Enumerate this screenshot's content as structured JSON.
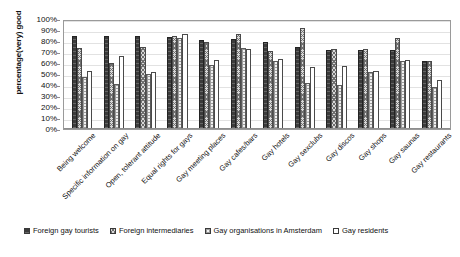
{
  "chart_data": {
    "type": "bar",
    "title": "",
    "xlabel": "",
    "ylabel": "percentage(very) good",
    "ylim": [
      0,
      100
    ],
    "grid": true,
    "legend_position": "bottom",
    "ytick_labels": [
      "100%",
      "90%",
      "80%",
      "70%",
      "60%",
      "50%",
      "40%",
      "30%",
      "20%",
      "10%",
      "0%"
    ],
    "ytick_values": [
      100,
      90,
      80,
      70,
      60,
      50,
      40,
      30,
      20,
      10,
      0
    ],
    "categories": [
      "Being welcome",
      "Specific information on gay",
      "Open, tolerant attitude",
      "Equal rights for gays",
      "Gay meeting places",
      "Gay cafes/bars",
      "Gay hotels",
      "Gay sexclubs",
      "Gay discos",
      "Gay shops",
      "Gay saunas",
      "Gay restaurants"
    ],
    "series": [
      {
        "name": "Foreign gay tourists",
        "pattern": "solid-dark",
        "values": [
          85,
          85,
          85,
          84,
          81,
          82,
          79,
          75,
          72,
          72,
          72,
          62
        ]
      },
      {
        "name": "Foreign intermediaries",
        "pattern": "cross-hatch",
        "values": [
          74,
          60,
          75,
          85,
          79,
          86,
          71,
          92,
          73,
          73,
          83,
          62
        ]
      },
      {
        "name": "Gay organisations in Amsterdam",
        "pattern": "dotted-grid",
        "values": [
          47,
          41,
          50,
          83,
          58,
          74,
          62,
          42,
          40,
          52,
          62,
          38
        ]
      },
      {
        "name": "Gay residents",
        "pattern": "white",
        "values": [
          53,
          66,
          52,
          86,
          63,
          73,
          64,
          56,
          57,
          53,
          63,
          45
        ]
      }
    ]
  }
}
